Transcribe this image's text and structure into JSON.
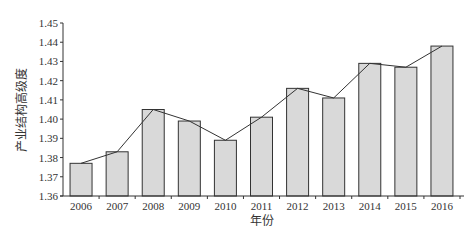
{
  "chart_data": {
    "type": "bar",
    "title": "",
    "xlabel": "年份",
    "ylabel": "产业结构高级度",
    "categories": [
      "2006",
      "2007",
      "2008",
      "2009",
      "2010",
      "2011",
      "2012",
      "2013",
      "2014",
      "2015",
      "2016"
    ],
    "series": [
      {
        "name": "产业结构高级度 (bar)",
        "type": "bar",
        "values": [
          1.377,
          1.383,
          1.405,
          1.399,
          1.389,
          1.401,
          1.416,
          1.411,
          1.429,
          1.427,
          1.438
        ]
      },
      {
        "name": "产业结构高级度 (line)",
        "type": "line",
        "values": [
          1.377,
          1.383,
          1.405,
          1.399,
          1.389,
          1.401,
          1.416,
          1.411,
          1.429,
          1.427,
          1.438
        ]
      }
    ],
    "ylim": [
      1.36,
      1.45
    ],
    "yticks": [
      "1.36",
      "1.37",
      "1.38",
      "1.39",
      "1.40",
      "1.41",
      "1.42",
      "1.43",
      "1.44",
      "1.45"
    ],
    "grid": false,
    "legend": "none",
    "colors": {
      "bar_fill": "#d9d9d9",
      "bar_stroke": "#333333",
      "line": "#333333",
      "axis": "#333333"
    }
  }
}
